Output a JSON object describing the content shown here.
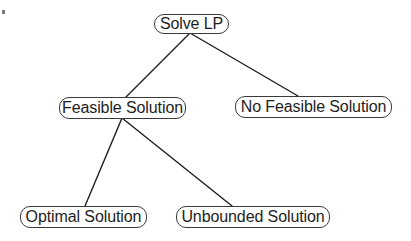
{
  "diagram": {
    "type": "tree",
    "stroke_color": "#1e1e1e",
    "nodes": [
      {
        "id": "solve_lp",
        "label": "Solve LP",
        "x": 154,
        "y": 14,
        "w": 75,
        "h": 20
      },
      {
        "id": "feasible",
        "label": "Feasible Solution",
        "x": 59,
        "y": 97,
        "w": 127,
        "h": 22
      },
      {
        "id": "no_feasible",
        "label": "No Feasible Solution",
        "x": 235,
        "y": 96,
        "w": 157,
        "h": 22
      },
      {
        "id": "optimal",
        "label": "Optimal Solution",
        "x": 20,
        "y": 206,
        "w": 127,
        "h": 22
      },
      {
        "id": "unbounded",
        "label": "Unbounded Solution",
        "x": 176,
        "y": 206,
        "w": 154,
        "h": 22
      }
    ],
    "edges": [
      {
        "from": "solve_lp",
        "to": "feasible",
        "x1": 190,
        "y1": 33,
        "x2": 126,
        "y2": 97
      },
      {
        "from": "solve_lp",
        "to": "no_feasible",
        "x1": 190,
        "y1": 33,
        "x2": 298,
        "y2": 96
      },
      {
        "from": "feasible",
        "to": "optimal",
        "x1": 122,
        "y1": 118,
        "x2": 85,
        "y2": 206
      },
      {
        "from": "feasible",
        "to": "unbounded",
        "x1": 122,
        "y1": 118,
        "x2": 232,
        "y2": 206
      }
    ]
  }
}
